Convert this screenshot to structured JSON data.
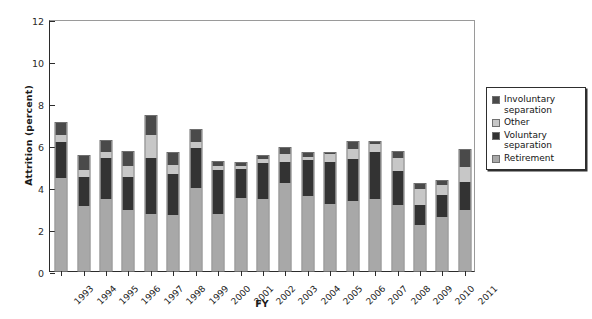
{
  "chart_data": {
    "type": "bar",
    "subtype": "stacked-vertical",
    "title": "",
    "subtitle": "",
    "xlabel": "FY",
    "ylabel": "Attrition (percent)",
    "ylim": [
      0,
      12
    ],
    "yticks": [
      0,
      2,
      4,
      6,
      8,
      10,
      12
    ],
    "ytick_labels": [
      "0",
      "2",
      "4",
      "6",
      "8",
      "10",
      "12"
    ],
    "grid": false,
    "legend_position": "right-outside",
    "legend_order_top_to_bottom": [
      "Involuntary separation",
      "Other",
      "Voluntary separation",
      "Retirement"
    ],
    "categories": [
      "1993",
      "1994",
      "1995",
      "1996",
      "1997",
      "1998",
      "1999",
      "2000",
      "2001",
      "2002",
      "2003",
      "2004",
      "2005",
      "2006",
      "2007",
      "2008",
      "2009",
      "2010",
      "2011"
    ],
    "stack_order_bottom_to_top": [
      "Retirement",
      "Voluntary separation",
      "Other",
      "Involuntary separation"
    ],
    "series": [
      {
        "name": "Retirement",
        "color": "#a8a8a8",
        "values": [
          4.45,
          3.1,
          3.45,
          2.9,
          2.7,
          2.65,
          3.95,
          2.7,
          3.5,
          3.45,
          4.2,
          3.55,
          3.2,
          3.35,
          3.45,
          3.15,
          2.2,
          2.55,
          2.9
        ]
      },
      {
        "name": "Voluntary separation",
        "color": "#333333",
        "values": [
          1.7,
          1.4,
          1.95,
          1.6,
          2.7,
          1.95,
          1.9,
          2.1,
          1.35,
          1.7,
          1.0,
          1.75,
          2.0,
          2.0,
          2.2,
          1.6,
          0.95,
          1.05,
          1.35
        ]
      },
      {
        "name": "Other",
        "color": "#c7c7c7",
        "values": [
          0.35,
          0.3,
          0.25,
          0.5,
          1.1,
          0.45,
          0.3,
          0.2,
          0.15,
          0.2,
          0.35,
          0.15,
          0.35,
          0.45,
          0.4,
          0.65,
          0.75,
          0.5,
          0.7
        ]
      },
      {
        "name": "Involuntary separation",
        "color": "#4a4a4a",
        "values": [
          0.55,
          0.7,
          0.55,
          0.65,
          0.9,
          0.55,
          0.55,
          0.2,
          0.15,
          0.15,
          0.3,
          0.15,
          0.05,
          0.35,
          0.1,
          0.25,
          0.25,
          0.2,
          0.8
        ]
      }
    ],
    "totals": [
      7.05,
      5.5,
      6.2,
      5.65,
      7.4,
      5.6,
      6.7,
      5.2,
      5.15,
      5.5,
      5.85,
      5.6,
      5.6,
      6.15,
      6.15,
      5.65,
      4.15,
      4.3,
      5.75
    ]
  },
  "legend": {
    "items": [
      {
        "label": "Involuntary separation",
        "color": "#4a4a4a"
      },
      {
        "label": "Other",
        "color": "#c7c7c7"
      },
      {
        "label": "Voluntary separation",
        "color": "#333333"
      },
      {
        "label": "Retirement",
        "color": "#a8a8a8"
      }
    ]
  },
  "colors": {
    "axis": "#2b2b2b",
    "frame": "#9a9a9a",
    "background": "#ffffff",
    "retirement": "#a8a8a8",
    "voluntary_separation": "#333333",
    "other": "#c7c7c7",
    "involuntary_separation": "#4a4a4a"
  }
}
